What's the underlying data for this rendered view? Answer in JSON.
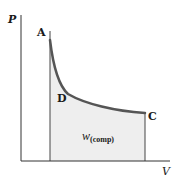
{
  "diagram": {
    "type": "P-V diagram",
    "axes": {
      "y_label": "P",
      "x_label": "V"
    },
    "points": [
      {
        "label": "A"
      },
      {
        "label": "D"
      },
      {
        "label": "C"
      }
    ],
    "shaded_area_label": {
      "symbol": "w",
      "subscript": "(comp)"
    },
    "colors": {
      "curve": "#555555",
      "axes": "#333333",
      "fill": "#eeeeee",
      "text": "#1a1a1a"
    }
  }
}
